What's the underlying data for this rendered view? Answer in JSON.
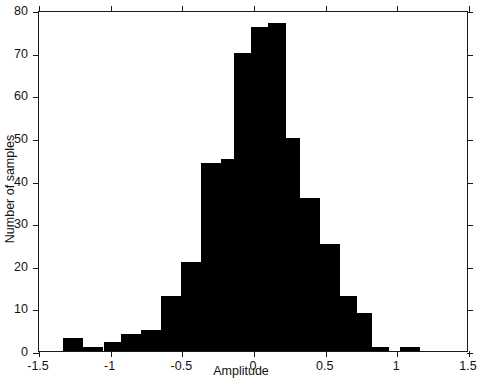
{
  "chart_data": {
    "type": "bar",
    "title": "",
    "subtitle": "",
    "xlabel": "Amplitude",
    "ylabel": "Number of samples",
    "xlim": [
      -1.5,
      1.5
    ],
    "ylim": [
      0,
      80
    ],
    "grid": false,
    "legend": null,
    "xticks": [
      "-1.5",
      "-1",
      "-0.5",
      "0",
      "0.5",
      "1",
      "1.5"
    ],
    "xtick_values": [
      -1.5,
      -1,
      -0.5,
      0,
      0.5,
      1,
      1.5
    ],
    "yticks": [
      "0",
      "10",
      "20",
      "30",
      "40",
      "50",
      "60",
      "70",
      "80"
    ],
    "ytick_values": [
      0,
      10,
      20,
      30,
      40,
      50,
      60,
      70,
      80
    ],
    "bin_width": 0.14,
    "bin_left_edges": [
      -1.33,
      -1.19,
      -1.05,
      -0.91,
      -0.77,
      -0.63,
      -0.49,
      -0.35,
      -0.21,
      -0.07,
      0.07,
      0.21,
      0.35,
      0.49,
      0.63,
      0.77,
      0.91,
      1.05
    ],
    "bin_centers": [
      -1.26,
      -1.12,
      -0.98,
      -0.84,
      -0.7,
      -0.56,
      -0.42,
      -0.28,
      -0.14,
      0.0,
      0.14,
      0.28,
      0.42,
      0.56,
      0.7,
      0.84,
      0.98,
      1.12
    ],
    "values": [
      3,
      1,
      2,
      4,
      5,
      13,
      21,
      44,
      45,
      70,
      76,
      77,
      50,
      36,
      25,
      13,
      9,
      1,
      0,
      1
    ],
    "bars": [
      {
        "x0": -1.33,
        "x1": -1.19,
        "value": 3
      },
      {
        "x0": -1.19,
        "x1": -1.05,
        "value": 1
      },
      {
        "x0": -1.05,
        "x1": -0.93,
        "value": 2
      },
      {
        "x0": -0.93,
        "x1": -0.79,
        "value": 4
      },
      {
        "x0": -0.79,
        "x1": -0.65,
        "value": 5
      },
      {
        "x0": -0.65,
        "x1": -0.51,
        "value": 13
      },
      {
        "x0": -0.51,
        "x1": -0.37,
        "value": 21
      },
      {
        "x0": -0.37,
        "x1": -0.23,
        "value": 44
      },
      {
        "x0": -0.23,
        "x1": -0.14,
        "value": 45
      },
      {
        "x0": -0.14,
        "x1": -0.02,
        "value": 70
      },
      {
        "x0": -0.02,
        "x1": 0.1,
        "value": 76
      },
      {
        "x0": 0.1,
        "x1": 0.22,
        "value": 77
      },
      {
        "x0": 0.22,
        "x1": 0.32,
        "value": 50
      },
      {
        "x0": 0.32,
        "x1": 0.46,
        "value": 36
      },
      {
        "x0": 0.46,
        "x1": 0.6,
        "value": 25
      },
      {
        "x0": 0.6,
        "x1": 0.72,
        "value": 13
      },
      {
        "x0": 0.72,
        "x1": 0.82,
        "value": 9
      },
      {
        "x0": 0.82,
        "x1": 0.94,
        "value": 1
      },
      {
        "x0": 1.02,
        "x1": 1.16,
        "value": 1
      }
    ],
    "colors": {
      "bar": "#000000",
      "axis": "#1a1a1a",
      "background": "#ffffff"
    }
  }
}
